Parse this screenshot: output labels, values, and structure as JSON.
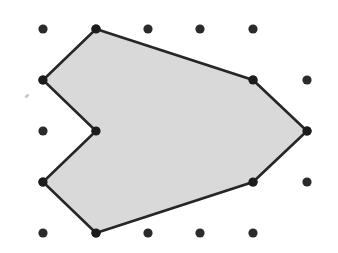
{
  "figure": {
    "background_color": "#ffffff",
    "canvas": {
      "width": 338,
      "height": 253
    }
  },
  "grid": {
    "name": "geoboard-dot-lattice",
    "dot_color": "#2b2b2b",
    "dot_radius": 4.6,
    "columns_x": [
      43,
      96,
      148,
      200,
      253,
      307
    ],
    "rows_y": [
      29,
      80,
      131,
      182,
      233
    ],
    "spacing_x": 52,
    "spacing_y": 51,
    "points": [
      {
        "x": 43,
        "y": 29
      },
      {
        "x": 96,
        "y": 29
      },
      {
        "x": 148,
        "y": 29
      },
      {
        "x": 200,
        "y": 29
      },
      {
        "x": 253,
        "y": 29
      },
      {
        "x": 43,
        "y": 80
      },
      {
        "x": 96,
        "y": 80
      },
      {
        "x": 148,
        "y": 80
      },
      {
        "x": 200,
        "y": 80
      },
      {
        "x": 253,
        "y": 80
      },
      {
        "x": 307,
        "y": 80
      },
      {
        "x": 43,
        "y": 131
      },
      {
        "x": 96,
        "y": 131
      },
      {
        "x": 148,
        "y": 131
      },
      {
        "x": 200,
        "y": 131
      },
      {
        "x": 253,
        "y": 131
      },
      {
        "x": 307,
        "y": 131
      },
      {
        "x": 43,
        "y": 182
      },
      {
        "x": 96,
        "y": 182
      },
      {
        "x": 148,
        "y": 182
      },
      {
        "x": 200,
        "y": 182
      },
      {
        "x": 253,
        "y": 182
      },
      {
        "x": 307,
        "y": 182
      },
      {
        "x": 43,
        "y": 233
      },
      {
        "x": 96,
        "y": 233
      },
      {
        "x": 148,
        "y": 233
      },
      {
        "x": 200,
        "y": 233
      },
      {
        "x": 253,
        "y": 233
      }
    ]
  },
  "shape": {
    "name": "arrow-polygon",
    "fill_color": "#d9d9d9",
    "stroke_color": "#262626",
    "stroke_width": 2.6,
    "vertex_count": 8,
    "convex": false,
    "path": "M 96 29 L 253 80 L 307 131 L 253 182 L 96 233 L 43 182 L 96 131 L 43 80 Z",
    "vertices": [
      {
        "label": "top",
        "x": 96,
        "y": 29
      },
      {
        "label": "upper-right",
        "x": 253,
        "y": 80
      },
      {
        "label": "far-right-tip",
        "x": 307,
        "y": 131
      },
      {
        "label": "lower-right",
        "x": 253,
        "y": 182
      },
      {
        "label": "bottom",
        "x": 96,
        "y": 233
      },
      {
        "label": "lower-left",
        "x": 43,
        "y": 182
      },
      {
        "label": "notch-center",
        "x": 96,
        "y": 131
      },
      {
        "label": "upper-left",
        "x": 43,
        "y": 80
      }
    ]
  },
  "speck": {
    "name": "paper-speck",
    "x": 27,
    "y": 96,
    "width": 5,
    "height": 3
  }
}
